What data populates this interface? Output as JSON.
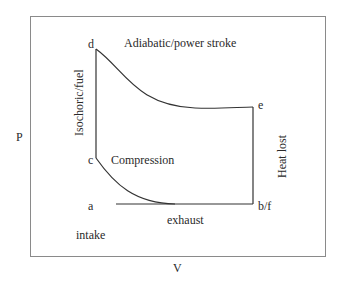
{
  "diagram": {
    "axis_labels": {
      "y": "P",
      "x": "V"
    },
    "points": {
      "a": "a",
      "b_f": "b/f",
      "c": "c",
      "d": "d",
      "e": "e"
    },
    "process_labels": {
      "power": "Adiabatic/power stroke",
      "isochoric": "Isochoric/fuel",
      "compression": "Compression",
      "heat_lost": "Heat lost",
      "exhaust": "exhaust",
      "intake": "intake"
    },
    "colors": {
      "line": "#333333",
      "frame": "#8a8a8a",
      "text": "#2a2a2a"
    }
  }
}
